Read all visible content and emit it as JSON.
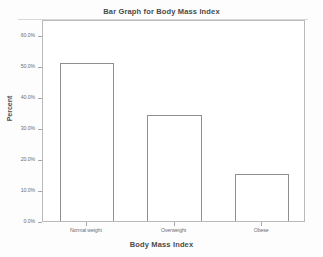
{
  "chart_data": {
    "type": "bar",
    "title": "Bar Graph for Body Mass Index",
    "xlabel": "Body Mass Index",
    "ylabel": "Percent",
    "categories": [
      "Normal weight",
      "Overweight",
      "Obese"
    ],
    "values": [
      51.0,
      34.0,
      15.0
    ],
    "ylim": [
      0,
      65
    ],
    "yticks": [
      0,
      10,
      20,
      30,
      40,
      50,
      60
    ],
    "ytick_labels": [
      "0.0%",
      "10.0%",
      "20.0%",
      "30.0%",
      "40.0%",
      "50.0%",
      "60.0%"
    ],
    "grid": false,
    "legend": false,
    "bar_fill": "#ffffff",
    "bar_edge": "#8f8f8f",
    "frame_color": "#b9b9b9",
    "background": "#ffffff"
  }
}
